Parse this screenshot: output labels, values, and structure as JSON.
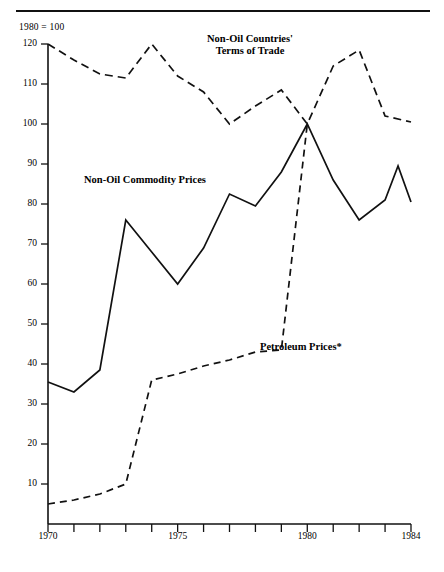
{
  "figure": {
    "note": "1980 = 100",
    "has_top_rule": true
  },
  "chart_data": {
    "type": "line",
    "title": "",
    "subtitle": "",
    "note": "1980 = 100",
    "xlabel": "",
    "ylabel": "",
    "xlim": [
      1970,
      1984
    ],
    "ylim": [
      0,
      124
    ],
    "yticks": [
      10,
      20,
      30,
      40,
      50,
      60,
      70,
      80,
      90,
      100,
      110,
      120
    ],
    "ytick_labels": [
      "10",
      "20",
      "30",
      "40",
      "50",
      "60",
      "70",
      "80",
      "90",
      "100",
      "110",
      "120"
    ],
    "xticks": [
      1970,
      1971,
      1972,
      1973,
      1974,
      1975,
      1976,
      1977,
      1978,
      1979,
      1980,
      1981,
      1982,
      1983,
      1984
    ],
    "xtick_labels_shown": [
      "1970",
      "1975",
      "1980",
      "1984"
    ],
    "xtick_labels_shown_at": [
      1970,
      1975,
      1980,
      1984
    ],
    "grid": false,
    "legend_position": "inline-annotations",
    "x": [
      1970,
      1971,
      1972,
      1973,
      1974,
      1975,
      1976,
      1977,
      1978,
      1979,
      1980,
      1981,
      1982,
      1983,
      1984
    ],
    "series": [
      {
        "name": "Non-Oil Countries' Terms of Trade",
        "style": "dashed",
        "color": "#000000",
        "values": [
          120,
          116,
          112.5,
          111.5,
          120,
          112,
          108,
          100,
          104.5,
          108.5,
          100,
          114.5,
          118.5,
          102,
          100.5
        ]
      },
      {
        "name": "Non-Oil Commodity Prices",
        "style": "solid",
        "color": "#000000",
        "values": [
          35.5,
          33,
          38.5,
          76,
          68,
          60,
          69,
          82.5,
          79.5,
          88,
          100,
          86,
          76,
          81,
          80.5
        ],
        "extra_points": [
          {
            "x": 1983.5,
            "y": 89.5
          }
        ]
      },
      {
        "name": "Petroleum Prices*",
        "style": "dashed",
        "color": "#000000",
        "values": [
          5,
          6,
          7.5,
          10,
          36,
          37.5,
          39.5,
          41,
          43,
          43.5,
          100,
          82,
          60,
          44,
          24
        ],
        "note": "line terminates at 1980 peak in the drawing"
      }
    ],
    "annotations": [
      {
        "text": "Non-Oil Countries' Terms of Trade",
        "x": 1975.8,
        "y": 118
      },
      {
        "text": "Non-Oil Commodity Prices",
        "x": 1971.5,
        "y": 86
      },
      {
        "text": "Petroleum Prices*",
        "x": 1979.1,
        "y": 44
      }
    ]
  },
  "labels": {
    "terms_of_trade_line1": "Non-Oil Countries'",
    "terms_of_trade_line2": "Terms of Trade",
    "commodity": "Non-Oil Commodity Prices",
    "petroleum": "Petroleum Prices*"
  },
  "axis": {
    "y_ticks": [
      "120",
      "110",
      "100",
      "90",
      "80",
      "70",
      "60",
      "50",
      "40",
      "30",
      "20",
      "10"
    ],
    "x_ticks": [
      "1970",
      "1975",
      "1980",
      "1984"
    ]
  }
}
